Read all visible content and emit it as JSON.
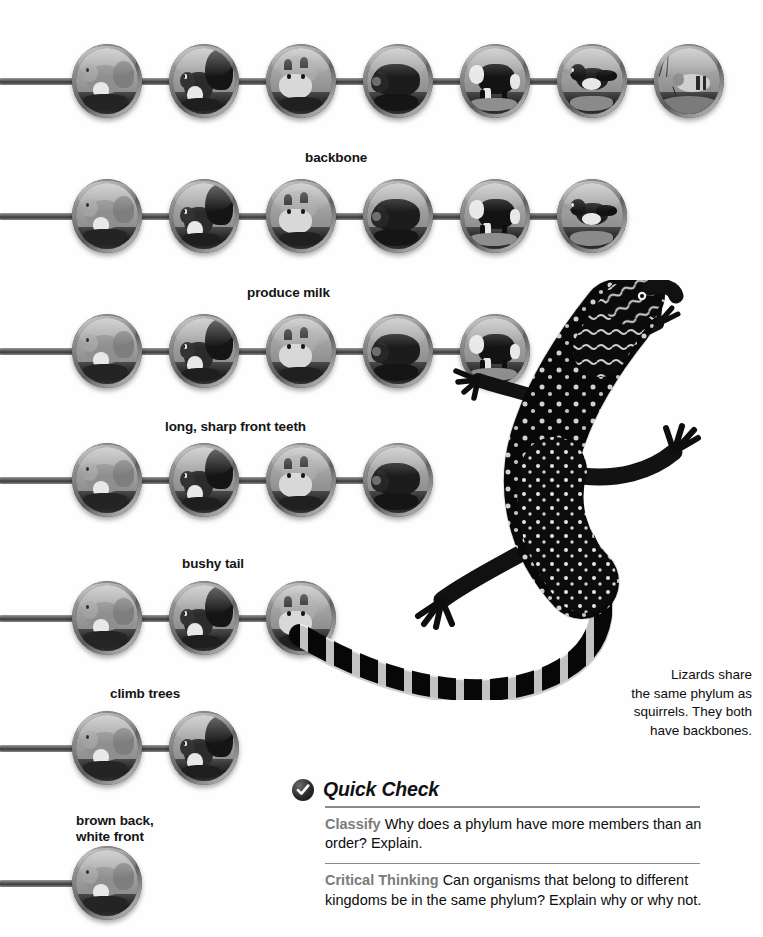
{
  "page": {
    "background": "#fefefe",
    "type": "science-textbook-classification-diagram"
  },
  "diagram": {
    "rows": [
      {
        "label": "",
        "bar_y": 78,
        "medallion_count": 7,
        "animals": [
          "chipmunk",
          "squirrel",
          "fox",
          "bear",
          "cow",
          "bird",
          "insect"
        ]
      },
      {
        "label": "backbone",
        "label_x": 305,
        "label_y": 150,
        "bar_y": 213,
        "medallion_count": 6,
        "animals": [
          "chipmunk",
          "squirrel",
          "fox",
          "bear",
          "cow",
          "bird"
        ]
      },
      {
        "label": "produce milk",
        "label_x": 247,
        "label_y": 285,
        "bar_y": 348,
        "medallion_count": 5,
        "animals": [
          "chipmunk",
          "squirrel",
          "fox",
          "bear",
          "cow"
        ]
      },
      {
        "label": "long, sharp front teeth",
        "label_x": 165,
        "label_y": 419,
        "bar_y": 477,
        "medallion_count": 4,
        "animals": [
          "chipmunk",
          "squirrel",
          "fox",
          "bear"
        ]
      },
      {
        "label": "bushy tail",
        "label_x": 182,
        "label_y": 556,
        "bar_y": 615,
        "medallion_count": 3,
        "animals": [
          "chipmunk",
          "squirrel",
          "fox"
        ]
      },
      {
        "label": "climb trees",
        "label_x": 110,
        "label_y": 686,
        "bar_y": 745,
        "medallion_count": 2,
        "animals": [
          "chipmunk",
          "squirrel"
        ]
      },
      {
        "label": "brown back,\nwhite front",
        "label_x": 76,
        "label_y": 813,
        "bar_y": 880,
        "medallion_count": 1,
        "animals": [
          "chipmunk"
        ]
      }
    ]
  },
  "lizard": {
    "alt": "black lizard with white spots and banded tail",
    "caption": "Lizards share\nthe same phylum as\nsquirrels. They both\nhave backbones.",
    "caption_x": 556,
    "caption_y": 666
  },
  "quick_check": {
    "badge_icon": "checkmark-icon",
    "title": "Quick Check",
    "items": [
      {
        "lead": "Classify",
        "text": "Why does a phylum have more members than an order? Explain."
      },
      {
        "lead": "Critical Thinking",
        "text": "Can organisms that belong to different kingdoms be in the same phylum? Explain why or why not."
      }
    ]
  },
  "colors": {
    "text": "#0d0d0d",
    "lead": "#7b7b7b",
    "rule": "#8a8a8a",
    "bar_dark": "#3c3c3c",
    "bar_light": "#9a9a9a"
  }
}
